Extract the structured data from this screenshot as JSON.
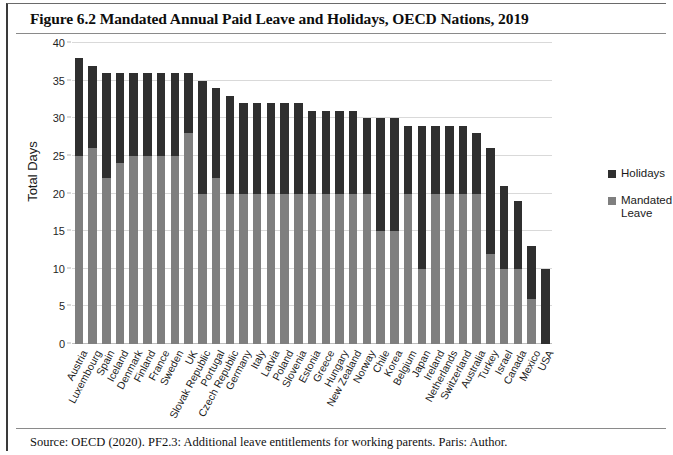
{
  "figure": {
    "title": "Figure 6.2 Mandated Annual Paid Leave and Holidays, OECD Nations, 2019",
    "source": "Source: OECD (2020). PF2.3: Additional leave entitlements for working parents. Paris: Author."
  },
  "legend": {
    "position": "right",
    "entries": [
      {
        "label": "Holidays",
        "color": "#2f2f2f"
      },
      {
        "label": "Mandated Leave",
        "color": "#7f7f7f"
      }
    ]
  },
  "chart_data": {
    "type": "bar",
    "stacked": true,
    "title": "Figure 6.2 Mandated Annual Paid Leave and Holidays, OECD Nations, 2019",
    "xlabel": "",
    "ylabel": "Total Days",
    "ylim": [
      0,
      40
    ],
    "yticks": [
      0,
      5,
      10,
      15,
      20,
      25,
      30,
      35,
      40
    ],
    "grid": true,
    "categories": [
      "Austria",
      "Luxembourg",
      "Spain",
      "Iceland",
      "Denmark",
      "Finland",
      "France",
      "Sweden",
      "UK",
      "Slovak Republic",
      "Portugal",
      "Czech Republic",
      "Germany",
      "Italy",
      "Latvia",
      "Poland",
      "Slovenia",
      "Estonia",
      "Greece",
      "Hungary",
      "New Zealand",
      "Norway",
      "Chile",
      "Korea",
      "Belgium",
      "Japan",
      "Ireland",
      "Netherlands",
      "Switzerland",
      "Australia",
      "Turkey",
      "Israel",
      "Canada",
      "Mexico",
      "USA"
    ],
    "series": [
      {
        "name": "Mandated Leave",
        "color": "#7f7f7f",
        "values": [
          25,
          26,
          22,
          24,
          25,
          25,
          25,
          25,
          28,
          20,
          22,
          20,
          20,
          20,
          20,
          20,
          20,
          20,
          20,
          20,
          20,
          20,
          15,
          15,
          20,
          10,
          20,
          20,
          20,
          20,
          12,
          10,
          10,
          6,
          0
        ]
      },
      {
        "name": "Holidays",
        "color": "#2f2f2f",
        "values": [
          13,
          11,
          14,
          12,
          11,
          11,
          11,
          11,
          8,
          15,
          12,
          13,
          12,
          12,
          12,
          12,
          12,
          11,
          11,
          11,
          11,
          10,
          15,
          15,
          9,
          19,
          9,
          9,
          9,
          8,
          14,
          11,
          9,
          7,
          10
        ]
      }
    ],
    "totals": [
      38,
      37,
      36,
      36,
      36,
      36,
      36,
      36,
      36,
      35,
      34,
      33,
      32,
      32,
      32,
      32,
      32,
      31,
      31,
      31,
      31,
      30,
      30,
      30,
      29,
      29,
      29,
      29,
      29,
      28,
      26,
      21,
      19,
      13,
      10
    ]
  }
}
